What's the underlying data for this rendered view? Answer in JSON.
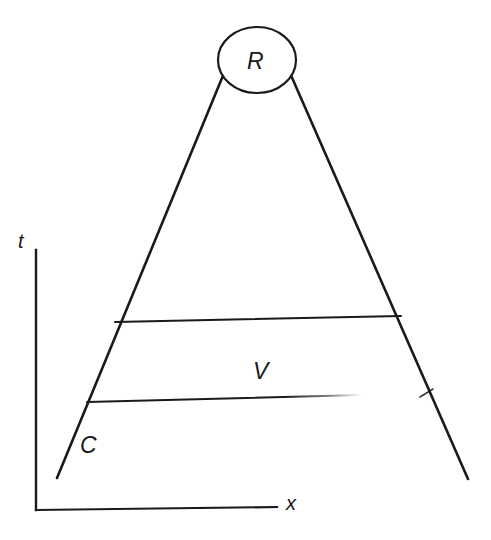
{
  "figure": {
    "type": "spacetime-diagram",
    "background_color": "#ffffff",
    "stroke_color": "#1a1a1a",
    "axes": {
      "vertical_axis_label": "t",
      "horizontal_axis_label": "x",
      "vertical_axis": {
        "x": 36,
        "y_top": 250,
        "y_bottom": 510
      },
      "horizontal_axis": {
        "y": 510,
        "x_left": 36,
        "x_right": 277
      }
    },
    "labels": {
      "apex_region": "R",
      "interior_region": "V",
      "left_boundary": "C",
      "time_axis": "t",
      "space_axis": "x"
    },
    "apex_ellipse": {
      "label": "R",
      "center_x": 257,
      "center_y": 60,
      "radius_x": 39,
      "radius_y": 33
    },
    "left_diagonal": {
      "x1": 57,
      "y1": 478,
      "x2": 241,
      "y2": 32
    },
    "right_diagonal": {
      "x1": 272,
      "y1": 32,
      "x2": 468,
      "y2": 479
    },
    "upper_horizontal": {
      "x1": 115,
      "y1": 322,
      "x2": 401,
      "y2": 316
    },
    "lower_horizontal": {
      "x1": 87,
      "y1": 402,
      "x2": 358,
      "y2": 396
    },
    "right_tick": {
      "x1": 421,
      "y1": 396,
      "x2": 434,
      "y2": 390
    }
  }
}
